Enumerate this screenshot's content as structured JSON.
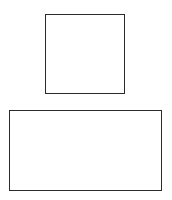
{
  "diagram": {
    "shapes": [
      {
        "type": "square",
        "x": 45,
        "y": 14,
        "width": 80,
        "height": 80,
        "stroke": "#2b2b2b",
        "stroke_width": 1.5,
        "fill": "#ffffff"
      },
      {
        "type": "rectangle",
        "x": 9,
        "y": 110,
        "width": 153,
        "height": 81,
        "stroke": "#2b2b2b",
        "stroke_width": 1.5,
        "fill": "#ffffff"
      }
    ]
  }
}
